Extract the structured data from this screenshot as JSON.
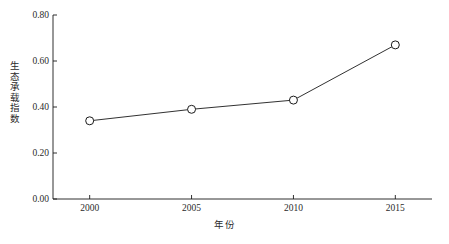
{
  "chart_data": {
    "type": "line",
    "title": "",
    "subtitle": "",
    "xlabel": "年份",
    "ylabel": "生态承载指数",
    "x": [
      2000,
      2005,
      2010,
      2015
    ],
    "categories": [
      "2000",
      "2005",
      "2010",
      "2015"
    ],
    "values": [
      0.34,
      0.39,
      0.43,
      0.67
    ],
    "series": [
      {
        "name": "生态承载指数",
        "values": [
          0.34,
          0.39,
          0.43,
          0.67
        ],
        "marker": "open-circle",
        "line_color": "#1a1a1a",
        "marker_fill": "#ffffff"
      }
    ],
    "xlim": [
      1998.2,
      2016.8
    ],
    "ylim": [
      0.0,
      0.8
    ],
    "yticks": [
      0.0,
      0.2,
      0.4,
      0.6,
      0.8
    ],
    "ytick_labels": [
      "0.00",
      "0.20",
      "0.40",
      "0.60",
      "0.80"
    ],
    "xticks": [
      2000,
      2005,
      2010,
      2015
    ],
    "xtick_labels": [
      "2000",
      "2005",
      "2010",
      "2015"
    ],
    "grid": false,
    "legend": null,
    "legend_position": "none",
    "annotations": [],
    "axis_color": "#1a1a1a",
    "background_color": "#ffffff"
  },
  "axis": {
    "y_title": "生态承载指数",
    "x_title": "年份",
    "y_labels": [
      "0.80",
      "0.60",
      "0.40",
      "0.20",
      "0.00"
    ],
    "x_labels": [
      "2000",
      "2005",
      "2010",
      "2015"
    ]
  }
}
